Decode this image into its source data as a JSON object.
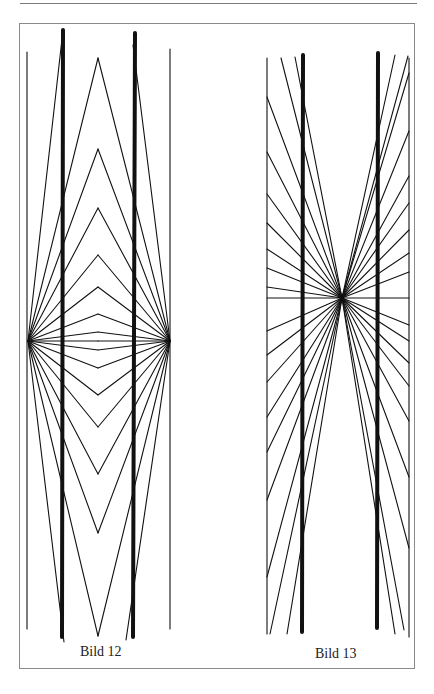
{
  "page": {
    "header_rule": true
  },
  "figures": [
    {
      "id": "bild-12",
      "caption": "Bild 12",
      "description": "Hering illusion: two straight thick vertical bars crossed by rays fanning from two focal points (left and right), forming nested chevrons",
      "focal_points": [
        [
          28,
          341
        ],
        [
          170,
          341
        ]
      ],
      "thin_verticals": [
        {
          "x": 27,
          "y1": 52,
          "y2": 629
        },
        {
          "x": 170,
          "y1": 49,
          "y2": 629
        }
      ],
      "thick_bars": [
        {
          "x1": 63,
          "y1": 30,
          "x2": 62,
          "y2": 637
        },
        {
          "x1": 135,
          "y1": 33,
          "x2": 133,
          "y2": 637
        }
      ],
      "apex_x": 98,
      "apex_y": [
        58,
        149,
        208,
        255,
        287,
        314,
        332,
        341,
        350,
        368,
        395,
        427,
        474,
        533,
        636
      ],
      "outer_rays": [
        {
          "from": [
            28,
            341
          ],
          "to": [
            63,
            30
          ]
        },
        {
          "from": [
            170,
            341
          ],
          "to": [
            133,
            45
          ]
        },
        {
          "from": [
            28,
            341
          ],
          "to": [
            64,
            642
          ]
        },
        {
          "from": [
            170,
            341
          ],
          "to": [
            126,
            640
          ]
        }
      ]
    },
    {
      "id": "bild-13",
      "caption": "Bild 13",
      "description": "Wundt-type illusion: two straight thick vertical bars crossed by rays from a single central focal point, with a horizontal line through the focus",
      "focal_point": [
        342,
        298
      ],
      "borders": [
        {
          "x": 267,
          "y1": 58,
          "y2": 634
        },
        {
          "x": 409,
          "y1": 58,
          "y2": 637
        }
      ],
      "thick_bars": [
        {
          "x1": 303,
          "y1": 55,
          "x2": 302,
          "y2": 632
        },
        {
          "x1": 378,
          "y1": 53,
          "x2": 377,
          "y2": 628
        }
      ],
      "horizontal_line": {
        "x1": 267,
        "x2": 409,
        "y": 298
      },
      "ray_endpoints": [
        [
          281,
          58
        ],
        [
          295,
          57
        ],
        [
          267,
          97
        ],
        [
          267,
          152
        ],
        [
          267,
          194
        ],
        [
          267,
          223
        ],
        [
          267,
          249
        ],
        [
          267,
          268
        ],
        [
          267,
          287
        ],
        [
          395,
          55
        ],
        [
          408,
          56
        ],
        [
          409,
          73
        ],
        [
          409,
          131
        ],
        [
          409,
          176
        ],
        [
          409,
          203
        ],
        [
          409,
          230
        ],
        [
          409,
          253
        ],
        [
          409,
          272
        ],
        [
          267,
          331
        ],
        [
          267,
          355
        ],
        [
          267,
          382
        ],
        [
          267,
          417
        ],
        [
          267,
          452
        ],
        [
          267,
          500
        ],
        [
          267,
          577
        ],
        [
          270,
          634
        ],
        [
          287,
          634
        ],
        [
          409,
          325
        ],
        [
          409,
          341
        ],
        [
          409,
          363
        ],
        [
          409,
          386
        ],
        [
          409,
          421
        ],
        [
          409,
          477
        ],
        [
          409,
          548
        ],
        [
          404,
          630
        ],
        [
          395,
          634
        ]
      ]
    }
  ]
}
